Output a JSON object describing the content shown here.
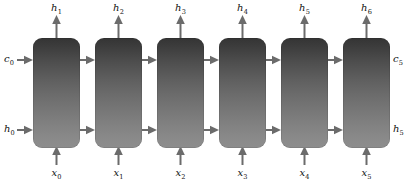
{
  "diagram": {
    "cell_count": 6,
    "colors": {
      "cell_top": "#343434",
      "cell_bottom": "#8d8d8d",
      "arrow": "#6b6b6b",
      "label": "#111111",
      "background": "#ffffff"
    },
    "cells": [
      {
        "id": "cell-0",
        "x": 33
      },
      {
        "id": "cell-1",
        "x": 95
      },
      {
        "id": "cell-2",
        "x": 157
      },
      {
        "id": "cell-3",
        "x": 219
      },
      {
        "id": "cell-4",
        "x": 281
      },
      {
        "id": "cell-5",
        "x": 343
      }
    ],
    "outputs_top": [
      {
        "name": "h",
        "sub": "1"
      },
      {
        "name": "h",
        "sub": "2"
      },
      {
        "name": "h",
        "sub": "3"
      },
      {
        "name": "h",
        "sub": "4"
      },
      {
        "name": "h",
        "sub": "5"
      },
      {
        "name": "h",
        "sub": "6"
      }
    ],
    "inputs_bottom": [
      {
        "name": "x",
        "sub": "0"
      },
      {
        "name": "x",
        "sub": "1"
      },
      {
        "name": "x",
        "sub": "2"
      },
      {
        "name": "x",
        "sub": "3"
      },
      {
        "name": "x",
        "sub": "4"
      },
      {
        "name": "x",
        "sub": "5"
      }
    ],
    "state_in_cell": {
      "name": "c",
      "sub": "0"
    },
    "state_in_hidden": {
      "name": "h",
      "sub": "0"
    },
    "state_out_cell": {
      "name": "c",
      "sub": "5"
    },
    "state_out_hidden": {
      "name": "h",
      "sub": "5"
    }
  }
}
